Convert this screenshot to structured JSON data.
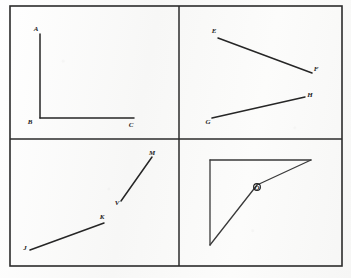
{
  "document": {
    "kind": "scanned-geometry-worksheet",
    "background_color": "#fbfbfa",
    "ink_color": "#2a2a2a",
    "frame": {
      "x": 10,
      "y": 6,
      "width": 332,
      "height": 260
    },
    "dividers": {
      "vertical_x": 179,
      "horizontal_y": 139
    }
  },
  "panels": [
    {
      "id": "panel-top-left",
      "name": "right-angle-figure",
      "bounds": {
        "x": 10,
        "y": 6,
        "width": 169,
        "height": 133
      },
      "labels": [
        {
          "text": "A",
          "x": 36,
          "y": 31
        },
        {
          "text": "B",
          "x": 30,
          "y": 124
        },
        {
          "text": "C",
          "x": 131,
          "y": 127
        }
      ],
      "segments": [
        {
          "name": "segment-ba",
          "x1": 40,
          "y1": 34,
          "x2": 40,
          "y2": 118
        },
        {
          "name": "segment-bc",
          "x1": 40,
          "y1": 118,
          "x2": 134,
          "y2": 118
        }
      ]
    },
    {
      "id": "panel-top-right",
      "name": "two-oblique-segments",
      "bounds": {
        "x": 179,
        "y": 6,
        "width": 163,
        "height": 133
      },
      "labels": [
        {
          "text": "E",
          "x": 214,
          "y": 33
        },
        {
          "text": "F",
          "x": 315,
          "y": 71
        },
        {
          "text": "G",
          "x": 208,
          "y": 123
        },
        {
          "text": "H",
          "x": 309,
          "y": 98
        }
      ],
      "segments": [
        {
          "name": "segment-ef",
          "x1": 218,
          "y1": 38,
          "x2": 312,
          "y2": 73
        },
        {
          "name": "segment-gh",
          "x1": 212,
          "y1": 118,
          "x2": 305,
          "y2": 97
        }
      ]
    },
    {
      "id": "panel-bottom-left",
      "name": "two-parallel-like-segments",
      "bounds": {
        "x": 10,
        "y": 139,
        "width": 169,
        "height": 127
      },
      "labels": [
        {
          "text": "J",
          "x": 25,
          "y": 249
        },
        {
          "text": "K",
          "x": 101,
          "y": 220
        },
        {
          "text": "V",
          "x": 117,
          "y": 204
        },
        {
          "text": "M",
          "x": 150,
          "y": 155
        }
      ],
      "segments": [
        {
          "name": "segment-jk",
          "x1": 30,
          "y1": 250,
          "x2": 104,
          "y2": 223
        },
        {
          "name": "segment-vm",
          "x1": 121,
          "y1": 201,
          "x2": 152,
          "y2": 157
        }
      ]
    },
    {
      "id": "panel-bottom-right",
      "name": "triangle-with-bent-hypotenuse",
      "bounds": {
        "x": 179,
        "y": 139,
        "width": 163,
        "height": 127
      },
      "labels": [
        {
          "text": "O",
          "x": 256,
          "y": 189
        }
      ],
      "segments": [
        {
          "name": "segment-vertical-leg",
          "x1": 210,
          "y1": 160,
          "x2": 210,
          "y2": 245
        },
        {
          "name": "segment-horizontal-leg",
          "x1": 210,
          "y1": 160,
          "x2": 311,
          "y2": 160
        },
        {
          "name": "segment-lower-bend",
          "x1": 210,
          "y1": 245,
          "x2": 257,
          "y2": 185
        },
        {
          "name": "segment-upper-bend",
          "x1": 257,
          "y1": 185,
          "x2": 311,
          "y2": 160
        }
      ],
      "vertex_marker": {
        "name": "vertex-o-circle",
        "cx": 257,
        "cy": 185,
        "r": 3.4
      }
    }
  ]
}
